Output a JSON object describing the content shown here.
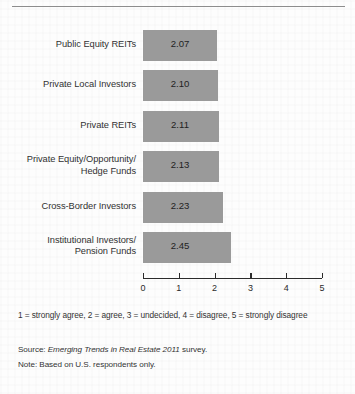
{
  "chart_data": {
    "type": "bar",
    "orientation": "horizontal",
    "title": "",
    "xlabel": "",
    "ylabel": "",
    "xlim": [
      0,
      5
    ],
    "grid": false,
    "legend": null,
    "categories": [
      "Public Equity REITs",
      "Private Local Investors",
      "Private REITs",
      "Private Equity/Opportunity/ Hedge Funds",
      "Cross-Border Investors",
      "Institutional Investors/ Pension Funds"
    ],
    "values": [
      2.07,
      2.1,
      2.11,
      2.13,
      2.23,
      2.45
    ],
    "value_labels": [
      "2.07",
      "2.10",
      "2.11",
      "2.13",
      "2.23",
      "2.45"
    ],
    "xticks": [
      0,
      1,
      2,
      3,
      4,
      5
    ],
    "xtick_labels": [
      "0",
      "1",
      "2",
      "3",
      "4",
      "5"
    ],
    "bar_color": "#9a9a9a",
    "axis_color": "#2b2b2b"
  },
  "bars": [
    {
      "label_line1": "Public Equity REITs",
      "label_line2": "",
      "value_label": "2.07",
      "value": 2.07
    },
    {
      "label_line1": "Private Local Investors",
      "label_line2": "",
      "value_label": "2.10",
      "value": 2.1
    },
    {
      "label_line1": "Private REITs",
      "label_line2": "",
      "value_label": "2.11",
      "value": 2.11
    },
    {
      "label_line1": "Private Equity/Opportunity/",
      "label_line2": "Hedge Funds",
      "value_label": "2.13",
      "value": 2.13
    },
    {
      "label_line1": "Cross-Border Investors",
      "label_line2": "",
      "value_label": "2.23",
      "value": 2.23
    },
    {
      "label_line1": "Institutional Investors/",
      "label_line2": "Pension Funds",
      "value_label": "2.45",
      "value": 2.45
    }
  ],
  "axis": {
    "ticks": [
      "0",
      "1",
      "2",
      "3",
      "4",
      "5"
    ]
  },
  "notes": {
    "scale_legend": "1 = strongly agree, 2 = agree, 3 = undecided, 4 = disagree, 5 = strongly disagree",
    "source_prefix": "Source: ",
    "source_italic": "Emerging Trends in Real Estate 2011",
    "source_suffix": " survey.",
    "note": "Note: Based on U.S. respondents only."
  }
}
